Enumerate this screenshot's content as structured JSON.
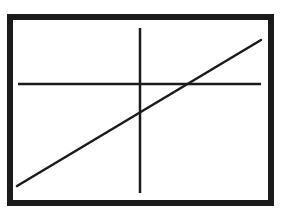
{
  "diagram": {
    "type": "graph-sketch",
    "colors": {
      "background": "#ffffff",
      "stroke": "#1a1a1a"
    },
    "frame": {
      "x": 10,
      "y": 17,
      "width": 261,
      "height": 186,
      "stroke_width": 6
    },
    "horizontal_axis": {
      "x1": 18,
      "y1": 84,
      "x2": 261,
      "y2": 84,
      "stroke_width": 2.5
    },
    "vertical_axis": {
      "x1": 140,
      "y1": 28,
      "x2": 140,
      "y2": 193,
      "stroke_width": 2.5
    },
    "diagonal_line": {
      "x1": 17,
      "y1": 186,
      "x2": 261,
      "y2": 40,
      "stroke_width": 2.5
    }
  }
}
